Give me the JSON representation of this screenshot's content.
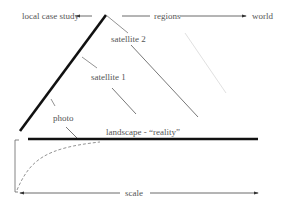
{
  "top_axis": {
    "left_label": "local case study",
    "middle_label": "regions",
    "right_label": "world"
  },
  "labels": {
    "satellite2": "satellite 2",
    "satellite1": "satellite 1",
    "photo": "photo",
    "landscape": "landscape - “reality”"
  },
  "bottom_axis": {
    "label": "scale"
  }
}
